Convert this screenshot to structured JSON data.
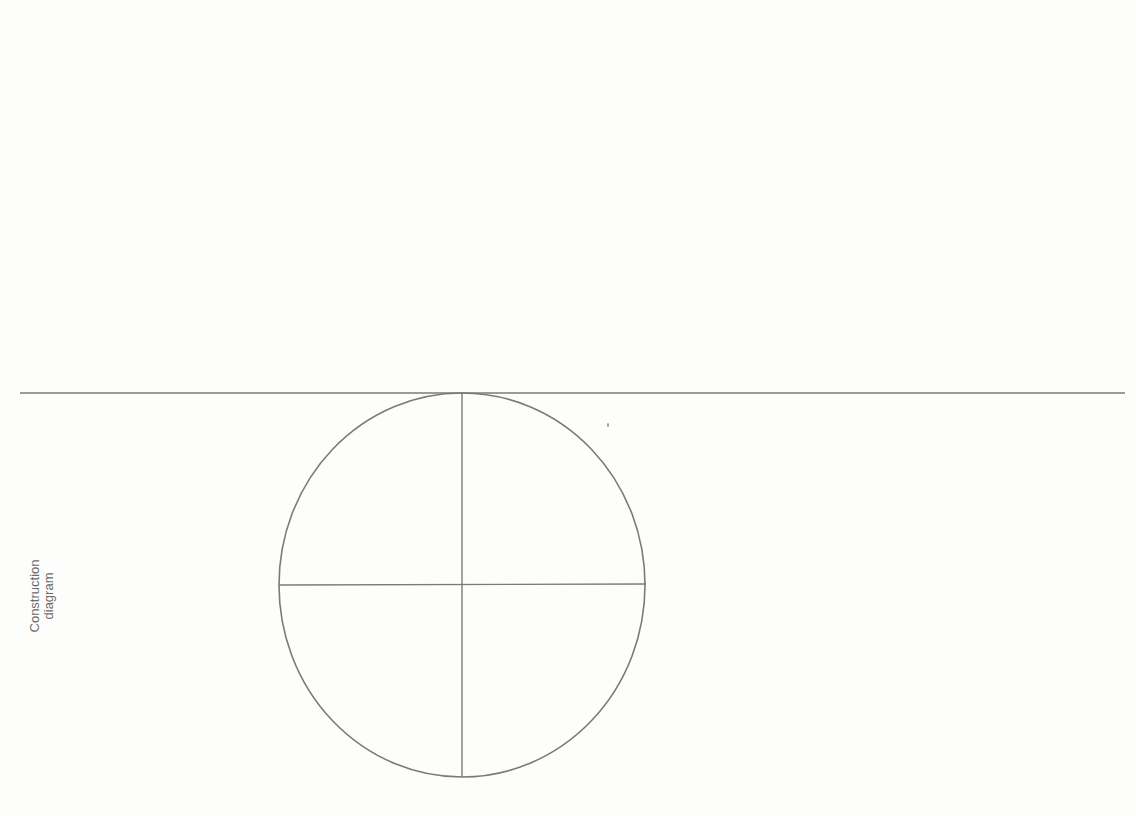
{
  "label": {
    "line1": "Construction",
    "line2": "diagram"
  },
  "colors": {
    "background": "#fdfdfc",
    "stroke": "#7a7a7a",
    "text": "#6b6b6b"
  },
  "diagram": {
    "baseline": {
      "x1": 20,
      "y1": 393,
      "x2": 1125,
      "y2": 393
    },
    "circle": {
      "cx": 462,
      "cy": 585,
      "rx": 183,
      "ry": 192
    },
    "vertical_axis": {
      "x1": 462,
      "y1": 393,
      "x2": 462,
      "y2": 777
    },
    "horizontal_axis": {
      "x1": 279,
      "y1": 585,
      "x2": 646,
      "y2": 584
    }
  }
}
